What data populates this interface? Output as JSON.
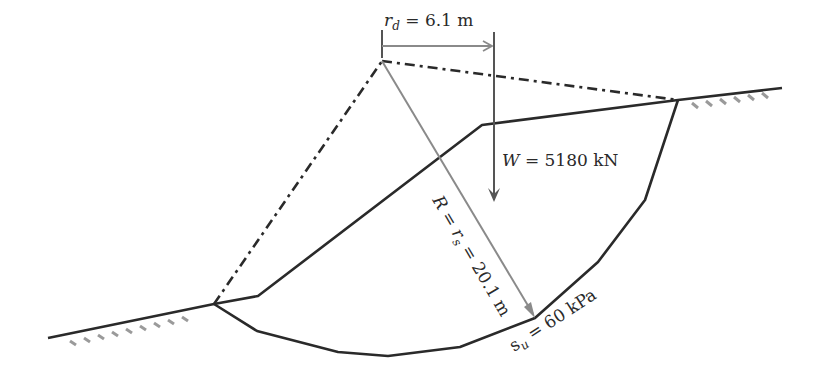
{
  "diagram": {
    "type": "slope-stability-circular-failure",
    "labels": {
      "rd_symbol": "r",
      "rd_sub": "d",
      "rd_value": " = 6.1 m",
      "weight_symbol": "W",
      "weight_value": " = 5180 kN",
      "radius_symbol": "R",
      "radius_eq": " = ",
      "rs_symbol": "r",
      "rs_sub": "s",
      "radius_value": " = 20.1 m",
      "su_symbol": "s",
      "su_sub": "u",
      "su_value": " = 60 kPa"
    },
    "colors": {
      "line": "#2a2a2a",
      "arrow_gray": "#8a8a8a",
      "hatch": "#9a9a9a"
    }
  }
}
